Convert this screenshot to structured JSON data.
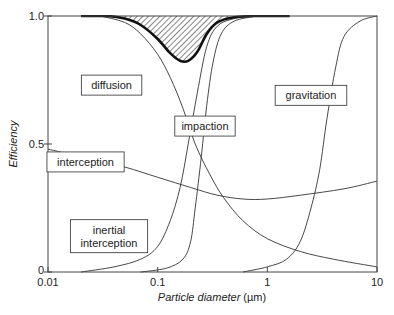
{
  "chart_data": {
    "type": "line",
    "title": "",
    "xlabel": "Particle diameter",
    "xlabel_unit": "(µm)",
    "ylabel": "Efficiency",
    "xscale": "log",
    "xlim": [
      0.01,
      10
    ],
    "ylim": [
      0,
      1.0
    ],
    "x_ticks": [
      {
        "value": 0.01,
        "label": "0.01"
      },
      {
        "value": 0.1,
        "label": "0.1"
      },
      {
        "value": 1,
        "label": "1"
      },
      {
        "value": 10,
        "label": "10"
      }
    ],
    "y_ticks": [
      {
        "value": 0,
        "label": "0"
      },
      {
        "value": 0.5,
        "label": "0.5"
      },
      {
        "value": 1.0,
        "label": "1.0"
      }
    ],
    "grid": false,
    "legend": "inline boxed labels",
    "series": [
      {
        "name": "diffusion",
        "label_box": {
          "x": 0.038,
          "y": 0.73
        },
        "points": [
          [
            0.03,
            1.0
          ],
          [
            0.05,
            0.975
          ],
          [
            0.07,
            0.93
          ],
          [
            0.1,
            0.85
          ],
          [
            0.13,
            0.76
          ],
          [
            0.17,
            0.64
          ],
          [
            0.22,
            0.5
          ],
          [
            0.3,
            0.38
          ],
          [
            0.4,
            0.29
          ],
          [
            0.6,
            0.2
          ],
          [
            1.0,
            0.13
          ],
          [
            2.0,
            0.08
          ],
          [
            4.0,
            0.05
          ],
          [
            10.0,
            0.02
          ]
        ]
      },
      {
        "name": "interception",
        "label_box": {
          "x": 0.022,
          "y": 0.43
        },
        "points": [
          [
            0.01,
            0.48
          ],
          [
            0.02,
            0.45
          ],
          [
            0.05,
            0.41
          ],
          [
            0.1,
            0.37
          ],
          [
            0.2,
            0.33
          ],
          [
            0.35,
            0.3
          ],
          [
            0.6,
            0.285
          ],
          [
            1.0,
            0.285
          ],
          [
            2.0,
            0.3
          ],
          [
            5.0,
            0.325
          ],
          [
            10.0,
            0.355
          ]
        ]
      },
      {
        "name": "inertial interception",
        "label_box": {
          "x": 0.036,
          "y": 0.14
        },
        "points": [
          [
            0.02,
            0.0
          ],
          [
            0.04,
            0.02
          ],
          [
            0.07,
            0.05
          ],
          [
            0.1,
            0.1
          ],
          [
            0.13,
            0.2
          ],
          [
            0.16,
            0.33
          ],
          [
            0.19,
            0.5
          ],
          [
            0.23,
            0.7
          ],
          [
            0.28,
            0.88
          ],
          [
            0.35,
            0.96
          ],
          [
            0.5,
            0.99
          ],
          [
            0.8,
            1.0
          ]
        ]
      },
      {
        "name": "impaction",
        "label_box": {
          "x": 0.27,
          "y": 0.57
        },
        "points": [
          [
            0.07,
            0.0
          ],
          [
            0.12,
            0.015
          ],
          [
            0.17,
            0.05
          ],
          [
            0.2,
            0.12
          ],
          [
            0.22,
            0.25
          ],
          [
            0.25,
            0.45
          ],
          [
            0.28,
            0.65
          ],
          [
            0.32,
            0.82
          ],
          [
            0.38,
            0.93
          ],
          [
            0.5,
            0.98
          ],
          [
            0.8,
            1.0
          ]
        ]
      },
      {
        "name": "gravitation",
        "label_box": {
          "x": 2.5,
          "y": 0.69
        },
        "points": [
          [
            0.6,
            0.0
          ],
          [
            1.0,
            0.02
          ],
          [
            1.5,
            0.05
          ],
          [
            2.0,
            0.12
          ],
          [
            2.5,
            0.25
          ],
          [
            3.0,
            0.4
          ],
          [
            3.5,
            0.6
          ],
          [
            4.2,
            0.8
          ],
          [
            5.0,
            0.92
          ],
          [
            7.0,
            0.98
          ],
          [
            10.0,
            1.0
          ]
        ]
      },
      {
        "name": "total efficiency",
        "style": "thick",
        "points": [
          [
            0.02,
            1.0
          ],
          [
            0.035,
            1.0
          ],
          [
            0.05,
            0.99
          ],
          [
            0.07,
            0.965
          ],
          [
            0.1,
            0.91
          ],
          [
            0.13,
            0.855
          ],
          [
            0.16,
            0.825
          ],
          [
            0.19,
            0.825
          ],
          [
            0.23,
            0.86
          ],
          [
            0.28,
            0.93
          ],
          [
            0.35,
            0.975
          ],
          [
            0.5,
            0.995
          ],
          [
            0.8,
            1.0
          ],
          [
            1.6,
            1.0
          ]
        ]
      }
    ],
    "annotations": [
      {
        "type": "hatched_region",
        "description": "area between 1.0 and total efficiency curve",
        "x_range": [
          0.035,
          0.8
        ]
      }
    ]
  }
}
